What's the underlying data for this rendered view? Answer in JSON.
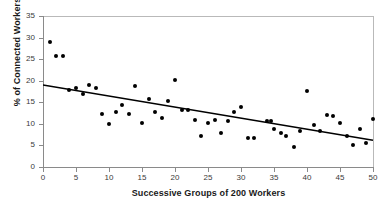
{
  "chart_data": {
    "type": "scatter",
    "title": "",
    "xlabel": "Successive Groups of 200 Workers",
    "ylabel": "% of Connected Workers",
    "xlim": [
      0,
      50
    ],
    "ylim": [
      0,
      35
    ],
    "xticks": [
      0,
      5,
      10,
      15,
      20,
      25,
      30,
      35,
      40,
      45,
      50
    ],
    "yticks": [
      0,
      5,
      10,
      15,
      20,
      25,
      30,
      35
    ],
    "grid": false,
    "legend": null,
    "marker_color": "#000000",
    "trendline_color": "#000000",
    "series": [
      {
        "name": "% of Connected Workers",
        "x": [
          1,
          2,
          3,
          4,
          5,
          6,
          7,
          8,
          9,
          10,
          11,
          12,
          13,
          14,
          15,
          16,
          17,
          18,
          19,
          20,
          21,
          22,
          23,
          24,
          25,
          26,
          27,
          28,
          29,
          30,
          31,
          32,
          34,
          34.6,
          35,
          36,
          36.8,
          38,
          39,
          40,
          41,
          42,
          43,
          44,
          45,
          46,
          47,
          48,
          49,
          50
        ],
        "y": [
          28.9,
          25.8,
          25.8,
          17.9,
          18.4,
          16.9,
          18.9,
          18.3,
          12.3,
          9.9,
          12.8,
          14.3,
          12.3,
          18.8,
          10.3,
          15.8,
          12.8,
          11.3,
          15.3,
          20.2,
          13.3,
          13.3,
          10.8,
          7.3,
          10.3,
          10.8,
          7.8,
          10.7,
          12.7,
          13.8,
          6.8,
          6.8,
          10.7,
          10.7,
          8.8,
          7.9,
          7.3,
          4.7,
          8.3,
          17.7,
          9.7,
          8.3,
          12.1,
          11.8,
          10.2,
          7.3,
          5.1,
          8.7,
          5.6,
          11.2
        ]
      }
    ],
    "trendline": {
      "x": [
        0,
        50
      ],
      "y": [
        19.0,
        6.2
      ]
    }
  }
}
